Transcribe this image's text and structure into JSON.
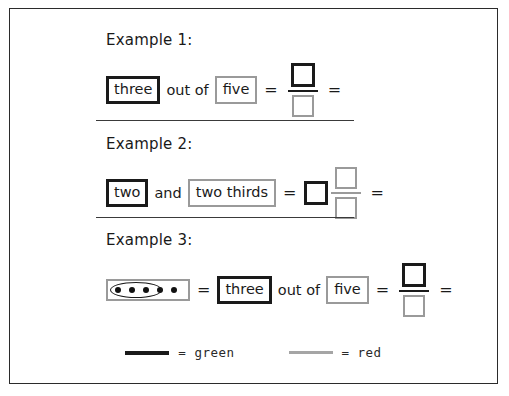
{
  "worksheet": {
    "examples": [
      {
        "title": "Example 1:",
        "word_green": "three",
        "connector": "out of",
        "word_red": "five",
        "equals_1": "=",
        "equals_2": "="
      },
      {
        "title": "Example 2:",
        "word_green": "two",
        "connector": "and",
        "word_red": "two thirds",
        "equals_1": "=",
        "equals_2": "="
      },
      {
        "title": "Example 3:",
        "word_green": "three",
        "connector": "out of",
        "word_red": "five",
        "equals_0": "=",
        "equals_1": "=",
        "equals_2": "="
      }
    ],
    "dot_diagram": {
      "total_dots": 5,
      "circled_dots": 3
    },
    "legend": {
      "green_label": "= green",
      "red_label": "= red",
      "green_color": "#1a1a1a",
      "red_color": "#a5a5a5"
    }
  }
}
